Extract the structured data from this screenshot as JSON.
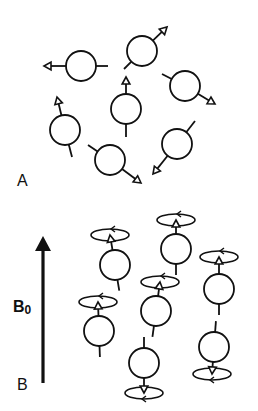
{
  "figure": {
    "panels": [
      {
        "id": "A",
        "label": "A",
        "description": "Nuclear spins randomly oriented in the absence of an external field",
        "spins": [
          {
            "cx": 81,
            "cy": 66,
            "tip": [
              44,
              66
            ],
            "tail": [
              108,
              66
            ]
          },
          {
            "cx": 142,
            "cy": 51,
            "tip": [
              167,
              27
            ],
            "tail": [
              124,
              69
            ]
          },
          {
            "cx": 185,
            "cy": 86,
            "tip": [
              215,
              104
            ],
            "tail": [
              162,
              74
            ]
          },
          {
            "cx": 126,
            "cy": 109,
            "tip": [
              126,
              77
            ],
            "tail": [
              126,
              137
            ]
          },
          {
            "cx": 65,
            "cy": 130,
            "tip": [
              57,
              97
            ],
            "tail": [
              72,
              157
            ]
          },
          {
            "cx": 110,
            "cy": 160,
            "tip": [
              141,
              183
            ],
            "tail": [
              88,
              145
            ]
          },
          {
            "cx": 177,
            "cy": 144,
            "tip": [
              153,
              174
            ],
            "tail": [
              195,
              121
            ]
          }
        ]
      },
      {
        "id": "B",
        "label": "B",
        "description": "Spins aligned and precessing in the external magnetic field B0",
        "field": {
          "label_main": "B",
          "label_sub": "0",
          "x": 43,
          "y_top": 236,
          "y_bottom": 383
        },
        "spins": [
          {
            "cx": 115,
            "cy": 265,
            "dir": "up",
            "orbit": [
              110,
              235
            ]
          },
          {
            "cx": 176,
            "cy": 249,
            "dir": "up",
            "orbit": [
              176,
              220
            ]
          },
          {
            "cx": 219,
            "cy": 289,
            "dir": "up",
            "orbit": [
              219,
              257
            ]
          },
          {
            "cx": 156,
            "cy": 311,
            "dir": "up",
            "orbit": [
              160,
              282
            ]
          },
          {
            "cx": 99,
            "cy": 331,
            "dir": "up",
            "orbit": [
              98,
              302
            ]
          },
          {
            "cx": 144,
            "cy": 363,
            "dir": "down",
            "orbit": [
              144,
              393
            ]
          },
          {
            "cx": 214,
            "cy": 347,
            "dir": "down",
            "orbit": [
              212,
              374
            ]
          }
        ]
      }
    ],
    "colors": {
      "ink": "#111111",
      "background": "#ffffff"
    }
  }
}
